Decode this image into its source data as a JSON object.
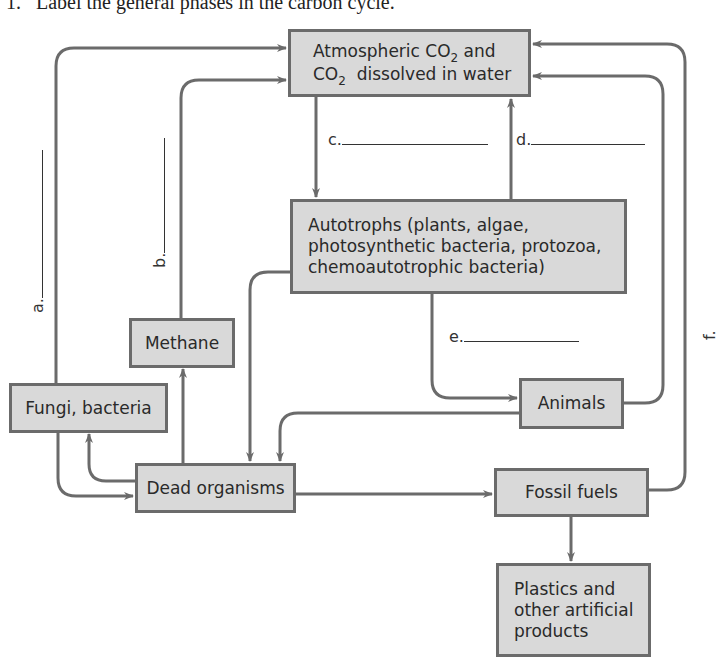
{
  "question": {
    "number": "1.",
    "text": "Label the general phases in the carbon cycle."
  },
  "nodes": {
    "atmospheric": {
      "line1_pre": "Atmospheric CO",
      "line1_sub": "2",
      "line1_post": " and",
      "line2_pre": "CO",
      "line2_sub": "2",
      "line2_post": "  dissolved in water"
    },
    "autotrophs": {
      "line1": "Autotrophs (plants, algae,",
      "line2": "photosynthetic bacteria, protozoa,",
      "line3": "chemoautotrophic bacteria)"
    },
    "methane": "Methane",
    "fungi": "Fungi, bacteria",
    "animals": "Animals",
    "dead": "Dead organisms",
    "fossil": "Fossil fuels",
    "plastics": {
      "line1": "Plastics and",
      "line2": "other artificial",
      "line3": "products"
    }
  },
  "blanks": {
    "a": "a.",
    "b": "b.",
    "c": "c.",
    "d": "d.",
    "e": "e.",
    "f": "f."
  },
  "colors": {
    "box_fill": "#d9d9d9",
    "box_border": "#6b6b6b",
    "arrow": "#6b6b6b"
  }
}
